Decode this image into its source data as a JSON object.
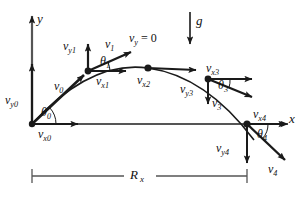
{
  "figure": {
    "background": "#ffffff",
    "stroke": "#1a1a1a",
    "axes": {
      "y_label": "y",
      "x_label": "x"
    },
    "gravity": {
      "label": "g"
    },
    "apex_note": {
      "v": "v",
      "sub": "y",
      "eq": " = 0"
    },
    "range": {
      "label": "R",
      "sub": "x"
    },
    "points": [
      {
        "id": "p0",
        "name": "launch-point",
        "v": {
          "base": "v",
          "sub": "0"
        },
        "vx": {
          "base": "v",
          "sub": "x0"
        },
        "vy": {
          "base": "v",
          "sub": "y0"
        },
        "theta": {
          "base": "θ",
          "sub": "0"
        }
      },
      {
        "id": "p1",
        "name": "rising-point",
        "v": {
          "base": "v",
          "sub": "1"
        },
        "vx": {
          "base": "v",
          "sub": "x1"
        },
        "vy": {
          "base": "v",
          "sub": "y1"
        },
        "theta": {
          "base": "θ",
          "sub": "1"
        }
      },
      {
        "id": "p2",
        "name": "apex-point",
        "vx": {
          "base": "v",
          "sub": "x2"
        }
      },
      {
        "id": "p3",
        "name": "falling-point",
        "v": {
          "base": "v",
          "sub": "3"
        },
        "vx": {
          "base": "v",
          "sub": "x3"
        },
        "vy": {
          "base": "v",
          "sub": "y3"
        },
        "theta": {
          "base": "θ",
          "sub": "3"
        }
      },
      {
        "id": "p4",
        "name": "landing-point",
        "v": {
          "base": "v",
          "sub": "4"
        },
        "vx": {
          "base": "v",
          "sub": "x4"
        },
        "vy": {
          "base": "v",
          "sub": "y4"
        },
        "theta": {
          "base": "θ",
          "sub": "4"
        }
      }
    ],
    "labels": {
      "y_axis": "y",
      "x_axis": "x",
      "g": "g",
      "vy_eq_zero_v": "v",
      "vy_eq_zero_sub": "y",
      "vy_eq_zero_rest": "= 0",
      "v0": "v",
      "v0_sub": "0",
      "v1": "v",
      "v1_sub": "1",
      "v3": "v",
      "v3_sub": "3",
      "v4": "v",
      "v4_sub": "4",
      "vx0": "v",
      "vx0_sub": "x0",
      "vx1": "v",
      "vx1_sub": "x1",
      "vx2": "v",
      "vx2_sub": "x2",
      "vx3": "v",
      "vx3_sub": "x3",
      "vx4": "v",
      "vx4_sub": "x4",
      "vy0": "v",
      "vy0_sub": "y0",
      "vy1": "v",
      "vy1_sub": "y1",
      "vy3": "v",
      "vy3_sub": "y3",
      "vy4": "v",
      "vy4_sub": "y4",
      "theta0": "θ",
      "theta0_sub": "0",
      "theta1": "θ",
      "theta1_sub": "1",
      "theta3": "θ",
      "theta3_sub": "3",
      "theta4": "θ",
      "theta4_sub": "4",
      "range": "R",
      "range_sub": "x"
    }
  }
}
